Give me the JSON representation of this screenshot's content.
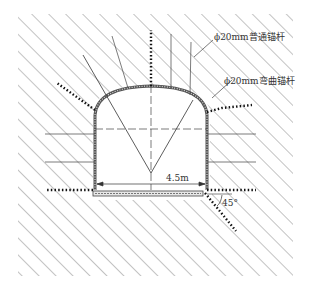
{
  "diagram": {
    "type": "tunnel-cross-section",
    "labels": {
      "normal_bolt": "ϕ20mm普通锚杆",
      "curved_bolt": "ϕ20mm弯曲锚杆",
      "width": "4.5m",
      "angle": "45°"
    },
    "colors": {
      "hatch": "#6a6a6a",
      "line": "#333333",
      "bolt_dots": "#111111",
      "background": "#ffffff"
    }
  }
}
